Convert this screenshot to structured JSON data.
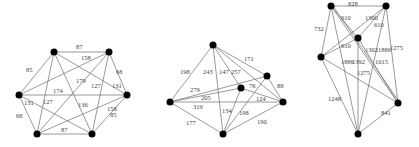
{
  "graphs": [
    {
      "id": "graph-1",
      "nodes": [
        {
          "id": "a",
          "x": 54,
          "y": 52
        },
        {
          "id": "b",
          "x": 109,
          "y": 52
        },
        {
          "id": "c",
          "x": 127,
          "y": 95
        },
        {
          "id": "d",
          "x": 92,
          "y": 134
        },
        {
          "id": "e",
          "x": 37,
          "y": 134
        },
        {
          "id": "f",
          "x": 19,
          "y": 95
        }
      ],
      "edges": [
        {
          "from": "a",
          "to": "b",
          "weight": "87",
          "lx": 79,
          "ly": 49
        },
        {
          "from": "a",
          "to": "f",
          "weight": "85",
          "lx": 28,
          "ly": 71
        },
        {
          "from": "b",
          "to": "c",
          "weight": "68",
          "lx": 118,
          "ly": 72
        },
        {
          "from": "f",
          "to": "e",
          "weight": "68",
          "lx": 18,
          "ly": 116
        },
        {
          "from": "c",
          "to": "d",
          "weight": "85",
          "lx": 112,
          "ly": 117
        },
        {
          "from": "e",
          "to": "d",
          "weight": "87",
          "lx": 63,
          "ly": 132
        },
        {
          "from": "a",
          "to": "c",
          "weight": "158",
          "lx": 83,
          "ly": 60
        },
        {
          "from": "f",
          "to": "b",
          "weight": "179",
          "lx": 79,
          "ly": 82
        },
        {
          "from": "f",
          "to": "c",
          "weight": "174",
          "lx": 55,
          "ly": 92
        },
        {
          "from": "b",
          "to": "d",
          "weight": "127",
          "lx": 92,
          "ly": 88
        },
        {
          "from": "c",
          "to": "a",
          "weight": "131",
          "lx": 115,
          "ly": 87
        },
        {
          "from": "a",
          "to": "e",
          "weight": "127",
          "lx": 45,
          "ly": 103
        },
        {
          "from": "f",
          "to": "d",
          "weight": "131",
          "lx": 26,
          "ly": 104
        },
        {
          "from": "a",
          "to": "d",
          "weight": "136",
          "lx": 79,
          "ly": 106
        },
        {
          "from": "e",
          "to": "c",
          "weight": "158",
          "lx": 110,
          "ly": 110
        },
        {
          "from": "e",
          "to": "b",
          "weight": "",
          "lx": 0,
          "ly": 0
        }
      ]
    },
    {
      "id": "graph-2",
      "nodes": [
        {
          "id": "t",
          "x": 213,
          "y": 45
        },
        {
          "id": "l",
          "x": 170,
          "y": 102
        },
        {
          "id": "m",
          "x": 241,
          "y": 88
        },
        {
          "id": "r1",
          "x": 267,
          "y": 76
        },
        {
          "id": "r",
          "x": 283,
          "y": 102
        },
        {
          "id": "bt",
          "x": 223,
          "y": 134
        }
      ],
      "edges": [
        {
          "from": "t",
          "to": "l",
          "weight": "198",
          "lx": 182,
          "ly": 73
        },
        {
          "from": "t",
          "to": "bt",
          "weight": "243",
          "lx": 207,
          "ly": 73
        },
        {
          "from": "t",
          "to": "m",
          "weight": "147",
          "lx": 222,
          "ly": 73
        },
        {
          "from": "t",
          "to": "r",
          "weight": "257",
          "lx": 235,
          "ly": 73
        },
        {
          "from": "t",
          "to": "r1",
          "weight": "171",
          "lx": 247,
          "ly": 60
        },
        {
          "from": "l",
          "to": "r1",
          "weight": "279",
          "lx": 194,
          "ly": 90
        },
        {
          "from": "l",
          "to": "m",
          "weight": "205",
          "lx": 205,
          "ly": 99
        },
        {
          "from": "l",
          "to": "r",
          "weight": "319",
          "lx": 196,
          "ly": 108
        },
        {
          "from": "l",
          "to": "bt",
          "weight": "177",
          "lx": 188,
          "ly": 124
        },
        {
          "from": "m",
          "to": "r",
          "weight": "76",
          "lx": 251,
          "ly": 87
        },
        {
          "from": "r1",
          "to": "r",
          "weight": "88",
          "lx": 279,
          "ly": 87
        },
        {
          "from": "m",
          "to": "bt",
          "weight": "134",
          "lx": 225,
          "ly": 112
        },
        {
          "from": "r1",
          "to": "bt",
          "weight": "198",
          "lx": 243,
          "ly": 114
        },
        {
          "from": "r",
          "to": "bt",
          "weight": "190",
          "lx": 259,
          "ly": 123
        },
        {
          "from": "l",
          "to": "r_extra",
          "weight": "124",
          "lx": 258,
          "ly": 102
        }
      ]
    },
    {
      "id": "graph-3",
      "nodes": [
        {
          "id": "tl",
          "x": 331,
          "y": 6
        },
        {
          "id": "tr",
          "x": 386,
          "y": 6
        },
        {
          "id": "mid",
          "x": 358,
          "y": 38
        },
        {
          "id": "lf",
          "x": 321,
          "y": 57
        },
        {
          "id": "rt",
          "x": 398,
          "y": 103
        },
        {
          "id": "bm",
          "x": 358,
          "y": 134
        }
      ],
      "edges": [
        {
          "from": "tl",
          "to": "tr",
          "weight": "828",
          "lx": 352,
          "ly": 5
        },
        {
          "from": "tl",
          "to": "lf",
          "weight": "732",
          "lx": 317,
          "ly": 30
        },
        {
          "from": "tl",
          "to": "mid",
          "weight": "610",
          "lx": 343,
          "ly": 19
        },
        {
          "from": "tl",
          "to": "rt",
          "weight": "1302",
          "lx": 370,
          "ly": 52
        },
        {
          "from": "tl",
          "to": "bm",
          "weight": "1886",
          "lx": 342,
          "ly": 62
        },
        {
          "from": "tr",
          "to": "mid",
          "weight": "1300",
          "lx": 369,
          "ly": 19
        },
        {
          "from": "tr",
          "to": "lf",
          "weight": "610",
          "lx": 376,
          "ly": 27
        },
        {
          "from": "tr",
          "to": "rt",
          "weight": "1275",
          "lx": 392,
          "ly": 50
        },
        {
          "from": "tr",
          "to": "bm",
          "weight": "1886",
          "lx": 384,
          "ly": 52
        },
        {
          "from": "mid",
          "to": "lf",
          "weight": "610",
          "lx": 336,
          "ly": 45
        },
        {
          "from": "mid",
          "to": "bm",
          "weight": "1392",
          "lx": 351,
          "ly": 62
        },
        {
          "from": "mid",
          "to": "rt",
          "weight": "1015",
          "lx": 378,
          "ly": 65
        },
        {
          "from": "lf",
          "to": "rt",
          "weight": "1275",
          "lx": 358,
          "ly": 73
        },
        {
          "from": "lf",
          "to": "bm",
          "weight": "1248",
          "lx": 331,
          "ly": 99
        },
        {
          "from": "rt",
          "to": "bm",
          "weight": "841",
          "lx": 382,
          "ly": 116
        }
      ]
    }
  ]
}
